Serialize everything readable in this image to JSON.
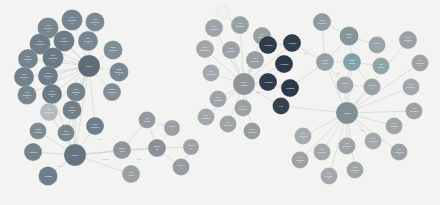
{
  "figure": {
    "caption": "Fig. 5.1 Graph of images and annotations",
    "watermark_label": "stock photo"
  },
  "palette": {
    "background": "#f3f3f1",
    "edge": "#b9b9b6",
    "slate": "#7c8b96",
    "slate_dark": "#64727d",
    "steel": "#6f7f8b",
    "navy": "#2e3b4a",
    "teal": "#7fa3a6",
    "grey": "#9aa0a3",
    "grey_light": "#a8adb0",
    "hub": "#5d6b76",
    "label_text": "#ffffff"
  },
  "chart_data": {
    "type": "diagram",
    "layout": "force-directed node-link graph",
    "clusters": [
      {
        "name": "video-annotation-cluster",
        "hub": "Image 1",
        "color": "#7c8b96"
      },
      {
        "name": "image-annotation-cluster",
        "hub": "Image 2",
        "color": "#6f7f8b"
      },
      {
        "name": "annotation-type-cluster",
        "hub": "Task or Annotation",
        "color": "#2e3b4a"
      },
      {
        "name": "pixel-annotation-cluster",
        "hub": "Image 3",
        "color": "#9aa0a3"
      },
      {
        "name": "metadata-cluster",
        "hub": "Dataset",
        "color": "#7fa3a6"
      }
    ]
  },
  "nodes": [
    {
      "id": "n1",
      "label": "Video annotation 1",
      "x": 48,
      "y": 28,
      "r": 10.5,
      "c": "#77868f",
      "t": "light"
    },
    {
      "id": "n2",
      "label": "Video annotation 2",
      "x": 72,
      "y": 20,
      "r": 10.5,
      "c": "#75848e",
      "t": "light"
    },
    {
      "id": "n3",
      "label": "Video annotation 3",
      "x": 95,
      "y": 22,
      "r": 9.5,
      "c": "#7b8993",
      "t": "light"
    },
    {
      "id": "n4",
      "label": "Video annotation 4",
      "x": 40,
      "y": 44,
      "r": 10.5,
      "c": "#6f7e89",
      "t": "light"
    },
    {
      "id": "n5",
      "label": "Video annotation 5",
      "x": 64,
      "y": 41,
      "r": 10.5,
      "c": "#6c7b86",
      "t": "light"
    },
    {
      "id": "n6",
      "label": "Video annotation 6",
      "x": 88,
      "y": 41,
      "r": 10,
      "c": "#78868f",
      "t": "light"
    },
    {
      "id": "n7",
      "label": "Video annotation 7",
      "x": 28,
      "y": 59,
      "r": 10,
      "c": "#74838d",
      "t": "light"
    },
    {
      "id": "n8",
      "label": "Video annotation 8",
      "x": 53,
      "y": 58,
      "r": 10.5,
      "c": "#6a7983",
      "t": "light"
    },
    {
      "id": "n9",
      "label": "Video annotation 9",
      "x": 24,
      "y": 77,
      "r": 10,
      "c": "#71808a",
      "t": "light"
    },
    {
      "id": "n10",
      "label": "Video annotation 10",
      "x": 48,
      "y": 76,
      "r": 10,
      "c": "#6d7c86",
      "t": "light"
    },
    {
      "id": "n11",
      "label": "Video annotation 11",
      "x": 27,
      "y": 95,
      "r": 9.5,
      "c": "#76858e",
      "t": "light"
    },
    {
      "id": "n12",
      "label": "Video annotation 12",
      "x": 52,
      "y": 94,
      "r": 10,
      "c": "#6b7a84",
      "t": "light"
    },
    {
      "id": "n13",
      "label": "Video annotation 13",
      "x": 76,
      "y": 92,
      "r": 9.5,
      "c": "#73828c",
      "t": "light"
    },
    {
      "id": "n14",
      "label": "Video annotation 14",
      "x": 49,
      "y": 112,
      "r": 9,
      "c": "#79879083",
      "t": "light"
    },
    {
      "id": "n15",
      "label": "Video annotation 15",
      "x": 72,
      "y": 110,
      "r": 9.5,
      "c": "#707f89",
      "t": "light"
    },
    {
      "id": "hub1",
      "label": "Image 1",
      "x": 89,
      "y": 66,
      "r": 11,
      "c": "#5e6c77",
      "t": "light"
    },
    {
      "id": "n16",
      "label": "Image annotation 1",
      "x": 113,
      "y": 50,
      "r": 9.5,
      "c": "#7f8d95",
      "t": "light"
    },
    {
      "id": "n17",
      "label": "Image annotation 2",
      "x": 119,
      "y": 72,
      "r": 9.5,
      "c": "#7a8891",
      "t": "light"
    },
    {
      "id": "n18",
      "label": "Image annotation 3",
      "x": 112,
      "y": 92,
      "r": 9,
      "c": "#818e96",
      "t": "light"
    },
    {
      "id": "n19",
      "label": "Video annotation",
      "x": 95,
      "y": 126,
      "r": 9,
      "c": "#6f7e88",
      "t": "light"
    },
    {
      "id": "n20",
      "label": "Video annotation",
      "x": 66,
      "y": 133,
      "r": 8.5,
      "c": "#77858e",
      "t": "light"
    },
    {
      "id": "n21",
      "label": "Image annotation",
      "x": 38,
      "y": 131,
      "r": 8.5,
      "c": "#7d8a92",
      "t": "light"
    },
    {
      "id": "hub2",
      "label": "Image 2",
      "x": 75,
      "y": 155,
      "r": 11,
      "c": "#66747f",
      "t": "light"
    },
    {
      "id": "n22",
      "label": "Annotation",
      "x": 33,
      "y": 152,
      "r": 9,
      "c": "#74828c",
      "t": "light"
    },
    {
      "id": "n23",
      "label": "Annotation",
      "x": 48,
      "y": 176,
      "r": 9.5,
      "c": "#6e7d87",
      "t": "light"
    },
    {
      "id": "n24",
      "label": "Bucket count",
      "x": 122,
      "y": 150,
      "r": 9,
      "c": "#8e969b",
      "t": "light"
    },
    {
      "id": "n25",
      "label": "Top center",
      "x": 131,
      "y": 174,
      "r": 9,
      "c": "#9aa1a5",
      "t": "light"
    },
    {
      "id": "n26",
      "label": "Dataset list",
      "x": 157,
      "y": 148,
      "r": 9,
      "c": "#8a9297",
      "t": "light"
    },
    {
      "id": "n27",
      "label": "ROI dataset",
      "x": 147,
      "y": 120,
      "r": 8.5,
      "c": "#93999d",
      "t": "light"
    },
    {
      "id": "n28",
      "label": "Sub cell 1",
      "x": 172,
      "y": 128,
      "r": 8,
      "c": "#9aa0a4",
      "t": "light"
    },
    {
      "id": "n29",
      "label": "Sub cell 2",
      "x": 181,
      "y": 167,
      "r": 8.5,
      "c": "#959c9f",
      "t": "light"
    },
    {
      "id": "n30",
      "label": "Sub cell 3",
      "x": 191,
      "y": 147,
      "r": 8,
      "c": "#9ba1a4",
      "t": "light"
    },
    {
      "id": "n31",
      "label": "Pixel annotation",
      "x": 214,
      "y": 28,
      "r": 9,
      "c": "#9da3a6",
      "t": "light"
    },
    {
      "id": "n32",
      "label": "Pixel annotation",
      "x": 240,
      "y": 25,
      "r": 9,
      "c": "#99a0a3",
      "t": "light"
    },
    {
      "id": "n33",
      "label": "Pixel annotation",
      "x": 262,
      "y": 36,
      "r": 9,
      "c": "#9aa0a3",
      "t": "light"
    },
    {
      "id": "n34",
      "label": "Pixel annotation",
      "x": 205,
      "y": 49,
      "r": 9,
      "c": "#a0a6a9",
      "t": "light"
    },
    {
      "id": "n35",
      "label": "Pixel annotation",
      "x": 231,
      "y": 50,
      "r": 9,
      "c": "#9ba1a4",
      "t": "light"
    },
    {
      "id": "n36",
      "label": "Pixel annotation",
      "x": 255,
      "y": 60,
      "r": 9,
      "c": "#979ea1",
      "t": "light"
    },
    {
      "id": "n37",
      "label": "Pixel annotation",
      "x": 211,
      "y": 73,
      "r": 8.5,
      "c": "#a2a8ab",
      "t": "light"
    },
    {
      "id": "hub3",
      "label": "Task or Annotation",
      "x": 244,
      "y": 84,
      "r": 11,
      "c": "#8e9498",
      "t": "light"
    },
    {
      "id": "n38",
      "label": "Pixel annotation",
      "x": 218,
      "y": 99,
      "r": 8.5,
      "c": "#9ea4a7",
      "t": "light"
    },
    {
      "id": "n39",
      "label": "Pixel annotation",
      "x": 243,
      "y": 108,
      "r": 8.5,
      "c": "#9aa0a3",
      "t": "light"
    },
    {
      "id": "n40",
      "label": "Pixel annotation",
      "x": 206,
      "y": 117,
      "r": 8.5,
      "c": "#a1a7aa",
      "t": "light"
    },
    {
      "id": "n41",
      "label": "Pixel annotation",
      "x": 228,
      "y": 124,
      "r": 8.5,
      "c": "#9da3a6",
      "t": "light"
    },
    {
      "id": "n42",
      "label": "Video annotation",
      "x": 252,
      "y": 131,
      "r": 8.5,
      "c": "#969da0",
      "t": "light"
    },
    {
      "id": "d1",
      "label": "Annotation",
      "x": 268,
      "y": 45,
      "r": 9,
      "c": "#2e3b4a",
      "t": "dark"
    },
    {
      "id": "d2",
      "label": "Annotation",
      "x": 292,
      "y": 43,
      "r": 9,
      "c": "#303d4c",
      "t": "dark"
    },
    {
      "id": "d3",
      "label": "Annotation",
      "x": 284,
      "y": 64,
      "r": 9,
      "c": "#2b3847",
      "t": "dark"
    },
    {
      "id": "d4",
      "label": "Annotation",
      "x": 268,
      "y": 82,
      "r": 9,
      "c": "#2f3c4b",
      "t": "dark"
    },
    {
      "id": "d5",
      "label": "Annotation",
      "x": 290,
      "y": 88,
      "r": 9,
      "c": "#2c3948",
      "t": "dark"
    },
    {
      "id": "d6",
      "label": "Pixel",
      "x": 281,
      "y": 106,
      "r": 8.5,
      "c": "#34414f",
      "t": "dark"
    },
    {
      "id": "r1",
      "label": "Test annotation",
      "x": 322,
      "y": 22,
      "r": 9,
      "c": "#8f9b9d",
      "t": "light"
    },
    {
      "id": "r2",
      "label": "Dataset item",
      "x": 349,
      "y": 36,
      "r": 9.5,
      "c": "#84959a",
      "t": "light"
    },
    {
      "id": "r3",
      "label": "Sub cell 1",
      "x": 377,
      "y": 45,
      "r": 8.5,
      "c": "#9aa3a5",
      "t": "light"
    },
    {
      "id": "r4",
      "label": "Feature dataset",
      "x": 352,
      "y": 62,
      "r": 9,
      "c": "#7fa3a6",
      "t": "light"
    },
    {
      "id": "r5",
      "label": "ROI dataset",
      "x": 381,
      "y": 66,
      "r": 8.5,
      "c": "#8ea6a8",
      "t": "light"
    },
    {
      "id": "r6",
      "label": "Bucket count",
      "x": 325,
      "y": 62,
      "r": 9,
      "c": "#94a0a3",
      "t": "light"
    },
    {
      "id": "r7",
      "label": "Sub cell 2",
      "x": 345,
      "y": 85,
      "r": 8.5,
      "c": "#9ba4a6",
      "t": "light"
    },
    {
      "id": "r8",
      "label": "Sub cell 3",
      "x": 372,
      "y": 87,
      "r": 8.5,
      "c": "#98a2a4",
      "t": "light"
    },
    {
      "id": "hub4",
      "label": "Image 3",
      "x": 347,
      "y": 113,
      "r": 11,
      "c": "#7f8f96",
      "t": "light"
    },
    {
      "id": "p1",
      "label": "Pixel annotation 1",
      "x": 408,
      "y": 40,
      "r": 9,
      "c": "#9aa0a3",
      "t": "light"
    },
    {
      "id": "p2",
      "label": "Pixel annotation 2",
      "x": 420,
      "y": 63,
      "r": 8.5,
      "c": "#9da3a6",
      "t": "light"
    },
    {
      "id": "p3",
      "label": "Pixel annotation 3",
      "x": 411,
      "y": 87,
      "r": 8.5,
      "c": "#a0a6a9",
      "t": "light"
    },
    {
      "id": "p4",
      "label": "Pixel annotation 4",
      "x": 414,
      "y": 111,
      "r": 8.5,
      "c": "#9ba1a4",
      "t": "light"
    },
    {
      "id": "p5",
      "label": "Pixel annotation 5",
      "x": 394,
      "y": 126,
      "r": 8.5,
      "c": "#9ea4a7",
      "t": "light"
    },
    {
      "id": "p6",
      "label": "Pixel annotation 6",
      "x": 399,
      "y": 152,
      "r": 8.5,
      "c": "#9aa0a3",
      "t": "light"
    },
    {
      "id": "p7",
      "label": "Pixel annotation 7",
      "x": 373,
      "y": 141,
      "r": 8.5,
      "c": "#a1a7aa",
      "t": "light"
    },
    {
      "id": "p8",
      "label": "Pixel annotation 8",
      "x": 347,
      "y": 146,
      "r": 8.5,
      "c": "#9da3a6",
      "t": "light"
    },
    {
      "id": "p9",
      "label": "Pixel annotation 9",
      "x": 322,
      "y": 152,
      "r": 8.5,
      "c": "#a0a6a9",
      "t": "light"
    },
    {
      "id": "p10",
      "label": "Pixel annotation 10",
      "x": 300,
      "y": 160,
      "r": 8.5,
      "c": "#9ba1a4",
      "t": "light"
    },
    {
      "id": "p11",
      "label": "Pixel annotation 11",
      "x": 355,
      "y": 170,
      "r": 8.5,
      "c": "#9ea4a7",
      "t": "light"
    },
    {
      "id": "p12",
      "label": "Pixel annotation 12",
      "x": 329,
      "y": 176,
      "r": 8.5,
      "c": "#a2a8ab",
      "t": "light"
    },
    {
      "id": "p13",
      "label": "Pixel annotation 13",
      "x": 303,
      "y": 136,
      "r": 8.5,
      "c": "#a4aaad",
      "t": "light"
    }
  ],
  "edges": [
    {
      "s": "hub1",
      "t": "n1"
    },
    {
      "s": "hub1",
      "t": "n2"
    },
    {
      "s": "hub1",
      "t": "n3"
    },
    {
      "s": "hub1",
      "t": "n4"
    },
    {
      "s": "hub1",
      "t": "n5"
    },
    {
      "s": "hub1",
      "t": "n6"
    },
    {
      "s": "hub1",
      "t": "n7"
    },
    {
      "s": "hub1",
      "t": "n8"
    },
    {
      "s": "hub1",
      "t": "n9"
    },
    {
      "s": "hub1",
      "t": "n10"
    },
    {
      "s": "hub1",
      "t": "n11"
    },
    {
      "s": "hub1",
      "t": "n12"
    },
    {
      "s": "hub1",
      "t": "n13"
    },
    {
      "s": "hub1",
      "t": "n14"
    },
    {
      "s": "hub1",
      "t": "n15"
    },
    {
      "s": "hub1",
      "t": "n16"
    },
    {
      "s": "hub1",
      "t": "n17"
    },
    {
      "s": "hub1",
      "t": "n18"
    },
    {
      "s": "hub1",
      "t": "n19"
    },
    {
      "s": "hub1",
      "t": "n20"
    },
    {
      "s": "hub1",
      "t": "hub2"
    },
    {
      "s": "hub2",
      "t": "n19"
    },
    {
      "s": "hub2",
      "t": "n20"
    },
    {
      "s": "hub2",
      "t": "n21"
    },
    {
      "s": "hub2",
      "t": "n22"
    },
    {
      "s": "hub2",
      "t": "n23"
    },
    {
      "s": "hub2",
      "t": "n12"
    },
    {
      "s": "hub2",
      "t": "n13"
    },
    {
      "s": "hub2",
      "t": "n14"
    },
    {
      "s": "hub2",
      "t": "n15"
    },
    {
      "s": "hub2",
      "t": "n24"
    },
    {
      "s": "hub2",
      "t": "n25"
    },
    {
      "s": "hub2",
      "t": "n26"
    },
    {
      "s": "n24",
      "t": "n26"
    },
    {
      "s": "n24",
      "t": "n27"
    },
    {
      "s": "n26",
      "t": "n28"
    },
    {
      "s": "n26",
      "t": "n29"
    },
    {
      "s": "n26",
      "t": "n30"
    },
    {
      "s": "n26",
      "t": "n27"
    },
    {
      "s": "n27",
      "t": "n28"
    },
    {
      "s": "n29",
      "t": "n30"
    },
    {
      "s": "hub3",
      "t": "n31"
    },
    {
      "s": "hub3",
      "t": "n32"
    },
    {
      "s": "hub3",
      "t": "n33"
    },
    {
      "s": "hub3",
      "t": "n34"
    },
    {
      "s": "hub3",
      "t": "n35"
    },
    {
      "s": "hub3",
      "t": "n36"
    },
    {
      "s": "hub3",
      "t": "n37"
    },
    {
      "s": "hub3",
      "t": "n38"
    },
    {
      "s": "hub3",
      "t": "n39"
    },
    {
      "s": "hub3",
      "t": "n40"
    },
    {
      "s": "hub3",
      "t": "n41"
    },
    {
      "s": "hub3",
      "t": "n42"
    },
    {
      "s": "hub3",
      "t": "d1"
    },
    {
      "s": "hub3",
      "t": "d2"
    },
    {
      "s": "hub3",
      "t": "d3"
    },
    {
      "s": "hub3",
      "t": "d4"
    },
    {
      "s": "hub3",
      "t": "d5"
    },
    {
      "s": "hub3",
      "t": "d6"
    },
    {
      "s": "d1",
      "t": "d2"
    },
    {
      "s": "d3",
      "t": "d4"
    },
    {
      "s": "d4",
      "t": "d5"
    },
    {
      "s": "d2",
      "t": "r6"
    },
    {
      "s": "d5",
      "t": "r6"
    },
    {
      "s": "d6",
      "t": "hub4"
    },
    {
      "s": "r6",
      "t": "r1"
    },
    {
      "s": "r6",
      "t": "r2"
    },
    {
      "s": "r6",
      "t": "r4"
    },
    {
      "s": "r6",
      "t": "r7"
    },
    {
      "s": "r2",
      "t": "r3"
    },
    {
      "s": "r2",
      "t": "r4"
    },
    {
      "s": "r4",
      "t": "r5"
    },
    {
      "s": "r4",
      "t": "r7"
    },
    {
      "s": "r4",
      "t": "r8"
    },
    {
      "s": "r7",
      "t": "r8"
    },
    {
      "s": "r2",
      "t": "r1"
    },
    {
      "s": "hub4",
      "t": "r6"
    },
    {
      "s": "hub4",
      "t": "r4"
    },
    {
      "s": "hub4",
      "t": "r7"
    },
    {
      "s": "hub4",
      "t": "r8"
    },
    {
      "s": "hub4",
      "t": "p1"
    },
    {
      "s": "hub4",
      "t": "p2"
    },
    {
      "s": "hub4",
      "t": "p3"
    },
    {
      "s": "hub4",
      "t": "p4"
    },
    {
      "s": "hub4",
      "t": "p5"
    },
    {
      "s": "hub4",
      "t": "p6"
    },
    {
      "s": "hub4",
      "t": "p7"
    },
    {
      "s": "hub4",
      "t": "p8"
    },
    {
      "s": "hub4",
      "t": "p9"
    },
    {
      "s": "hub4",
      "t": "p10"
    },
    {
      "s": "hub4",
      "t": "p11"
    },
    {
      "s": "hub4",
      "t": "p12"
    },
    {
      "s": "hub4",
      "t": "p13"
    }
  ],
  "edge_labels": [
    {
      "label": "Source",
      "x": 106,
      "y": 160
    },
    {
      "label": "Item",
      "x": 60,
      "y": 167
    },
    {
      "label": "Item",
      "x": 100,
      "y": 140
    },
    {
      "label": "Item",
      "x": 139,
      "y": 160
    },
    {
      "label": "Task",
      "x": 258,
      "y": 93
    },
    {
      "label": "Item",
      "x": 306,
      "y": 54
    },
    {
      "label": "Item",
      "x": 338,
      "y": 74
    },
    {
      "label": "Item",
      "x": 362,
      "y": 131
    }
  ]
}
